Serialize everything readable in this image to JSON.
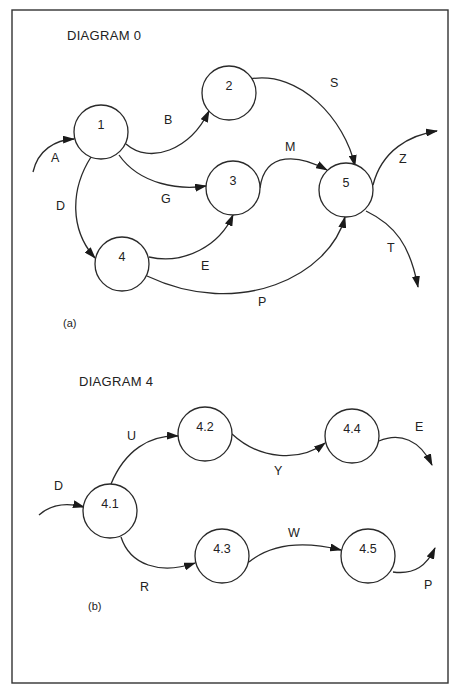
{
  "frame": {
    "x": 12,
    "y": 10,
    "w": 436,
    "h": 673
  },
  "diagrams": [
    {
      "title": "DIAGRAM 0",
      "title_pos": [
        67,
        40
      ],
      "caption": "(a)",
      "caption_pos": [
        63,
        327
      ],
      "nodes": [
        {
          "id": "1",
          "label": "1",
          "cx": 101,
          "cy": 132,
          "r": 27
        },
        {
          "id": "2",
          "label": "2",
          "cx": 229,
          "cy": 93,
          "r": 27
        },
        {
          "id": "3",
          "label": "3",
          "cx": 233,
          "cy": 188,
          "r": 27
        },
        {
          "id": "4",
          "label": "4",
          "cx": 122,
          "cy": 264,
          "r": 27
        },
        {
          "id": "5",
          "label": "5",
          "cx": 346,
          "cy": 190,
          "r": 27
        }
      ],
      "edges": [
        {
          "label": "A",
          "from": null,
          "to": "1",
          "d": "M33,172 C38,150 55,140 74,139",
          "label_pos": [
            51,
            162
          ]
        },
        {
          "label": "B",
          "from": "1",
          "to": "2",
          "d": "M126,144 C150,165 190,150 209,111",
          "label_pos": [
            164,
            124
          ]
        },
        {
          "label": "G",
          "from": "1",
          "to": "3",
          "d": "M119,155 C140,185 180,190 206,186",
          "label_pos": [
            161,
            203
          ]
        },
        {
          "label": "D",
          "from": "1",
          "to": "4",
          "d": "M91,157 C70,190 70,230 95,258",
          "label_pos": [
            56,
            210
          ]
        },
        {
          "label": "E",
          "from": "4",
          "to": "3",
          "d": "M149,257 C185,265 220,245 233,215",
          "label_pos": [
            201,
            270
          ]
        },
        {
          "label": "S",
          "from": "2",
          "to": "5",
          "d": "M250,79 C300,70 345,120 355,166",
          "label_pos": [
            330,
            87
          ]
        },
        {
          "label": "M",
          "from": "3",
          "to": "5",
          "d": "M260,188 C265,150 300,155 327,170",
          "label_pos": [
            285,
            151
          ]
        },
        {
          "label": "P",
          "from": "4",
          "to": "5",
          "d": "M147,276 C240,320 330,275 345,217",
          "label_pos": [
            258,
            306
          ]
        },
        {
          "label": "Z",
          "from": "5",
          "to": null,
          "d": "M373,185 C382,150 410,135 437,131",
          "label_pos": [
            399,
            163
          ]
        },
        {
          "label": "T",
          "from": "5",
          "to": null,
          "d": "M366,211 C395,225 410,245 418,287",
          "label_pos": [
            387,
            252
          ]
        }
      ]
    },
    {
      "title": "DIAGRAM 4",
      "title_pos": [
        79,
        386
      ],
      "caption": "(b)",
      "caption_pos": [
        88,
        610
      ],
      "nodes": [
        {
          "id": "4.1",
          "label": "4.1",
          "cx": 110,
          "cy": 511,
          "r": 27
        },
        {
          "id": "4.2",
          "label": "4.2",
          "cx": 205,
          "cy": 434,
          "r": 27
        },
        {
          "id": "4.3",
          "label": "4.3",
          "cx": 222,
          "cy": 556,
          "r": 27
        },
        {
          "id": "4.4",
          "label": "4.4",
          "cx": 352,
          "cy": 436,
          "r": 27
        },
        {
          "id": "4.5",
          "label": "4.5",
          "cx": 368,
          "cy": 556,
          "r": 27
        }
      ],
      "edges": [
        {
          "label": "D",
          "from": null,
          "to": "4.1",
          "d": "M39,515 C50,505 65,502 84,507",
          "label_pos": [
            54,
            490
          ]
        },
        {
          "label": "U",
          "from": "4.1",
          "to": "4.2",
          "d": "M111,484 C125,450 150,435 178,436",
          "label_pos": [
            127,
            440
          ]
        },
        {
          "label": "R",
          "from": "4.1",
          "to": "4.3",
          "d": "M121,537 C130,565 160,575 195,563",
          "label_pos": [
            140,
            591
          ]
        },
        {
          "label": "Y",
          "from": "4.2",
          "to": "4.4",
          "d": "M232,434 C260,460 300,462 325,443",
          "label_pos": [
            274,
            475
          ]
        },
        {
          "label": "W",
          "from": "4.3",
          "to": "4.5",
          "d": "M249,562 C270,545 300,540 341,550",
          "label_pos": [
            288,
            537
          ]
        },
        {
          "label": "E",
          "from": "4.4",
          "to": null,
          "d": "M379,441 C400,432 420,440 432,465",
          "label_pos": [
            415,
            431
          ]
        },
        {
          "label": "P",
          "from": "4.5",
          "to": null,
          "d": "M393,572 C415,575 427,565 435,548",
          "label_pos": [
            424,
            589
          ]
        }
      ]
    }
  ]
}
